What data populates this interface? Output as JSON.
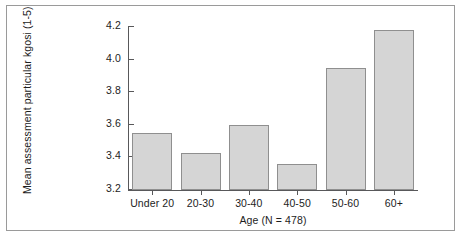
{
  "chart_data": {
    "type": "bar",
    "title": "",
    "subtitle": "",
    "xlabel": "Age (N = 478)",
    "ylabel": "Mean assessment particular kgosi (1-5)",
    "categories": [
      "Under 20",
      "20-30",
      "30-40",
      "40-50",
      "50-60",
      "60+"
    ],
    "values": [
      3.55,
      3.43,
      3.6,
      3.36,
      3.95,
      4.18
    ],
    "ylim": [
      3.2,
      4.2
    ],
    "yticks": [
      3.2,
      3.4,
      3.6,
      3.8,
      4.0,
      4.2
    ],
    "ytick_labels": [
      "3.2",
      "3.4",
      "3.6",
      "3.8",
      "4.0",
      "4.2"
    ],
    "grid": false,
    "legend": null,
    "legend_position": "none",
    "series": [
      {
        "name": "Mean assessment particular kgosi (1-5)",
        "values": [
          3.55,
          3.43,
          3.6,
          3.36,
          3.95,
          4.18
        ]
      }
    ],
    "annotations": []
  },
  "style": {
    "bar_fill": "#d5d5d5",
    "bar_edge": "#8f8f8f",
    "axis_color": "#58585a",
    "text_color": "#1d1d1d",
    "frame_color": "#9a9a9a",
    "background": "#ffffff"
  }
}
